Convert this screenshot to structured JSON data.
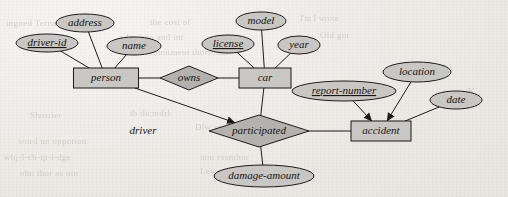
{
  "diagram": {
    "type": "entity-relationship",
    "notation": "Chen",
    "style": {
      "shape_fill": "#c9c7c4",
      "relationship_fill": "#b4b2af",
      "stroke": "#1d1b18",
      "paper": "#efedea",
      "text": "#15130f"
    },
    "entities": [
      {
        "id": "person",
        "label": "person",
        "x": 106,
        "y": 78,
        "w": 65,
        "h": 20
      },
      {
        "id": "car",
        "label": "car",
        "x": 265,
        "y": 78,
        "w": 52,
        "h": 20
      },
      {
        "id": "accident",
        "label": "accident",
        "x": 381,
        "y": 131,
        "w": 60,
        "h": 20
      }
    ],
    "relationships": [
      {
        "id": "owns",
        "label": "owns",
        "x": 189,
        "y": 78,
        "rx": 29,
        "ry": 12
      },
      {
        "id": "participated",
        "label": "participated",
        "x": 259,
        "y": 131,
        "rx": 50,
        "ry": 16
      }
    ],
    "attributes": [
      {
        "id": "address",
        "label": "address",
        "owner": "person",
        "x": 85,
        "y": 23,
        "rx": 29,
        "ry": 9,
        "key": false
      },
      {
        "id": "driver-id",
        "label": "driver-id",
        "owner": "person",
        "x": 47,
        "y": 43,
        "rx": 31,
        "ry": 9,
        "key": true
      },
      {
        "id": "name",
        "label": "name",
        "owner": "person",
        "x": 134,
        "y": 46,
        "rx": 27,
        "ry": 9,
        "key": false
      },
      {
        "id": "model",
        "label": "model",
        "owner": "car",
        "x": 261,
        "y": 21,
        "rx": 25,
        "ry": 9,
        "key": false
      },
      {
        "id": "license",
        "label": "license",
        "owner": "car",
        "x": 228,
        "y": 44,
        "rx": 26,
        "ry": 9,
        "key": true
      },
      {
        "id": "year",
        "label": "year",
        "owner": "car",
        "x": 299,
        "y": 45,
        "rx": 21,
        "ry": 9,
        "key": false
      },
      {
        "id": "report-number",
        "label": "report-number",
        "owner": "accident",
        "x": 344,
        "y": 91,
        "rx": 52,
        "ry": 10,
        "key": true
      },
      {
        "id": "location",
        "label": "location",
        "owner": "accident",
        "x": 417,
        "y": 72,
        "rx": 34,
        "ry": 10,
        "key": false
      },
      {
        "id": "date",
        "label": "date",
        "owner": "accident",
        "x": 456,
        "y": 100,
        "rx": 26,
        "ry": 9,
        "key": false
      },
      {
        "id": "damage-amount",
        "label": "damage-amount",
        "owner": "participated",
        "x": 264,
        "y": 176,
        "rx": 50,
        "ry": 11,
        "key": false
      }
    ],
    "role_labels": [
      {
        "id": "driver",
        "label": "driver",
        "x": 143,
        "y": 131
      }
    ],
    "edges": [
      {
        "from": "person",
        "to": "owns"
      },
      {
        "from": "owns",
        "to": "car"
      },
      {
        "from": "person",
        "to": "participated",
        "role": "driver",
        "arrow": true
      },
      {
        "from": "car",
        "to": "participated"
      },
      {
        "from": "participated",
        "to": "accident"
      },
      {
        "from": "participated",
        "to": "damage-amount"
      },
      {
        "from": "report-number",
        "to": "accident",
        "arrow": true
      },
      {
        "from": "location",
        "to": "accident",
        "arrow": true
      },
      {
        "from": "date",
        "to": "accident"
      },
      {
        "from": "address",
        "to": "person"
      },
      {
        "from": "driver-id",
        "to": "person"
      },
      {
        "from": "name",
        "to": "person"
      },
      {
        "from": "model",
        "to": "car"
      },
      {
        "from": "license",
        "to": "car"
      },
      {
        "from": "year",
        "to": "car"
      }
    ]
  },
  "bleed_through": [
    {
      "text": "ingned Ternadelapse on",
      "x": 6,
      "y": 18,
      "size": 9
    },
    {
      "text": "the cost of",
      "x": 150,
      "y": 17,
      "size": 9
    },
    {
      "text": "I'm  I wrote",
      "x": 300,
      "y": 14,
      "size": 8
    },
    {
      "text": "who into and int",
      "x": 120,
      "y": 32,
      "size": 9
    },
    {
      "text": "Old  got",
      "x": 320,
      "y": 30,
      "size": 9
    },
    {
      "text": "rountment thurrodurr",
      "x": 150,
      "y": 47,
      "size": 9
    },
    {
      "text": "Shorrier",
      "x": 30,
      "y": 110,
      "size": 9
    },
    {
      "text": "th  dicmdrk",
      "x": 130,
      "y": 108,
      "size": 9
    },
    {
      "text": "Dlw  nr",
      "x": 195,
      "y": 122,
      "size": 9
    },
    {
      "text": "word un oppotion",
      "x": 18,
      "y": 136,
      "size": 9
    },
    {
      "text": "non rxsmhnr",
      "x": 200,
      "y": 152,
      "size": 9
    },
    {
      "text": "whj-l-ch-tp-l-dge",
      "x": 4,
      "y": 152,
      "size": 9
    },
    {
      "text": "Lewore don stur",
      "x": 200,
      "y": 166,
      "size": 9
    },
    {
      "text": "ohn thor as uin",
      "x": 20,
      "y": 168,
      "size": 9
    },
    {
      "text": "cmdri",
      "x": 430,
      "y": 62,
      "size": 9
    },
    {
      "text": "K",
      "x": 468,
      "y": 86,
      "size": 10
    }
  ]
}
